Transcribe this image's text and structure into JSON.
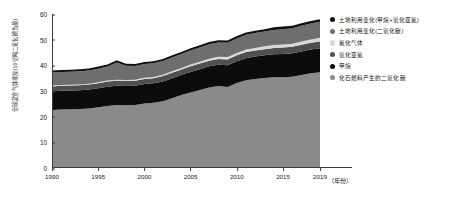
{
  "chart_data": {
    "type": "area",
    "title": "",
    "subtitle": "",
    "xlabel": "（年份）",
    "ylabel": "全球温室气体排放(10亿吨二氧化碳当量)",
    "grid": false,
    "legend_position": "right",
    "stacked": true,
    "xlim": [
      1990,
      2019
    ],
    "ylim": [
      0,
      60
    ],
    "yticks": [
      "0",
      "10",
      "20",
      "30",
      "40",
      "50",
      "60"
    ],
    "ytick_values": [
      0,
      10,
      20,
      30,
      40,
      50,
      60
    ],
    "xticks": [
      "1990",
      "1995",
      "2000",
      "2005",
      "2010",
      "2015",
      "2019"
    ],
    "xtick_values": [
      1990,
      1995,
      2000,
      2005,
      2010,
      2015,
      2019
    ],
    "x": [
      1990,
      1991,
      1992,
      1993,
      1994,
      1995,
      1996,
      1997,
      1998,
      1999,
      2000,
      2001,
      2002,
      2003,
      2004,
      2005,
      2006,
      2007,
      2008,
      2009,
      2010,
      2011,
      2012,
      2013,
      2014,
      2015,
      2016,
      2017,
      2018,
      2019
    ],
    "series": [
      {
        "name": "化石燃料产生的二氧化碳",
        "color": "#8a8a8a",
        "values": [
          22.6,
          22.8,
          22.9,
          23.0,
          23.2,
          23.7,
          24.2,
          24.5,
          24.4,
          24.5,
          25.1,
          25.4,
          26.0,
          27.2,
          28.4,
          29.4,
          30.4,
          31.4,
          31.9,
          31.6,
          33.1,
          34.2,
          34.7,
          35.1,
          35.4,
          35.4,
          35.6,
          36.2,
          36.9,
          37.3
        ]
      },
      {
        "name": "甲烷",
        "color": "#0c0c0c",
        "values": [
          7.3,
          7.3,
          7.3,
          7.3,
          7.4,
          7.4,
          7.5,
          7.5,
          7.5,
          7.5,
          7.6,
          7.6,
          7.7,
          7.8,
          7.9,
          8.0,
          8.1,
          8.2,
          8.3,
          8.4,
          8.5,
          8.6,
          8.7,
          8.8,
          8.9,
          9.0,
          9.1,
          9.2,
          9.3,
          9.4
        ]
      },
      {
        "name": "氧化亚氮",
        "color": "#4f4f4f",
        "values": [
          1.9,
          1.9,
          1.9,
          1.9,
          1.9,
          1.9,
          2.0,
          2.0,
          2.0,
          2.0,
          2.0,
          2.0,
          2.1,
          2.1,
          2.1,
          2.2,
          2.2,
          2.2,
          2.3,
          2.3,
          2.3,
          2.4,
          2.4,
          2.4,
          2.5,
          2.5,
          2.5,
          2.6,
          2.6,
          2.6
        ]
      },
      {
        "name": "氟化气体",
        "color": "#d8d8d8",
        "values": [
          0.3,
          0.3,
          0.3,
          0.3,
          0.3,
          0.4,
          0.4,
          0.4,
          0.4,
          0.4,
          0.5,
          0.5,
          0.5,
          0.6,
          0.6,
          0.7,
          0.7,
          0.8,
          0.8,
          0.9,
          0.9,
          1.0,
          1.0,
          1.1,
          1.1,
          1.2,
          1.2,
          1.3,
          1.3,
          1.4
        ]
      },
      {
        "name": "土地利用变化(二氧化碳)",
        "color": "#6e6e6e",
        "values": [
          5.1,
          5.1,
          5.1,
          5.2,
          5.2,
          5.3,
          5.4,
          6.7,
          5.5,
          5.3,
          5.3,
          5.3,
          5.4,
          5.4,
          5.4,
          5.5,
          5.5,
          5.6,
          5.6,
          5.6,
          5.7,
          5.7,
          5.8,
          5.8,
          5.9,
          6.0,
          6.0,
          6.1,
          6.2,
          6.3
        ]
      },
      {
        "name": "土地利用变化(甲烷+氧化亚氮)",
        "color": "#111111",
        "values": [
          0.8,
          0.8,
          0.8,
          0.8,
          0.8,
          0.8,
          0.8,
          0.9,
          0.8,
          0.8,
          0.8,
          0.8,
          0.8,
          0.8,
          0.8,
          0.9,
          0.9,
          0.9,
          0.9,
          0.9,
          0.9,
          0.9,
          0.9,
          0.9,
          1.0,
          1.0,
          1.0,
          1.0,
          1.0,
          1.0
        ]
      }
    ],
    "totals": [
      38.0,
      38.2,
      38.3,
      38.5,
      38.8,
      39.5,
      40.3,
      42.0,
      40.6,
      40.5,
      41.3,
      41.6,
      42.5,
      43.9,
      45.2,
      46.7,
      47.8,
      49.1,
      49.8,
      49.7,
      51.4,
      52.8,
      53.5,
      54.1,
      54.8,
      55.1,
      55.4,
      56.4,
      57.3,
      58.0
    ]
  },
  "legend": {
    "items": [
      {
        "label": "土地利用变化(甲烷+氧化亚氮)",
        "color": "#111111"
      },
      {
        "label": "土地利用变化(二氧化碳)",
        "color": "#6e6e6e"
      },
      {
        "label": "氟化气体",
        "color": "#d8d8d8"
      },
      {
        "label": "氧化亚氮",
        "color": "#4f4f4f"
      },
      {
        "label": "甲烷",
        "color": "#0c0c0c"
      },
      {
        "label": "化石燃料产生的二氧化碳",
        "color": "#8a8a8a"
      }
    ]
  },
  "axes": {
    "y_title": "全球温室气体排放(10亿吨二氧化碳当量)",
    "x_title": "（年份）",
    "y_ticks": [
      "60",
      "50",
      "40",
      "30",
      "20",
      "10",
      "0"
    ],
    "x_ticks": [
      "1990",
      "1995",
      "2000",
      "2005",
      "2010",
      "2015",
      "2019"
    ]
  }
}
